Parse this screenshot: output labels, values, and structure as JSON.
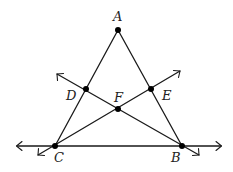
{
  "diagram": {
    "type": "geometry",
    "colors": {
      "line": "#1a1a1a",
      "point": "#000000",
      "label": "#222222",
      "background": "#ffffff"
    },
    "points": {
      "A": {
        "label": "A",
        "x": 118,
        "y": 30
      },
      "B": {
        "label": "B",
        "x": 182,
        "y": 146
      },
      "C": {
        "label": "C",
        "x": 55,
        "y": 146
      },
      "D": {
        "label": "D",
        "x": 86,
        "y": 89
      },
      "E": {
        "label": "E",
        "x": 151,
        "y": 89
      },
      "F": {
        "label": "F",
        "x": 118,
        "y": 109
      }
    },
    "segments": [
      {
        "name": "AC",
        "from": "A",
        "to": "C"
      },
      {
        "name": "AB",
        "from": "A",
        "to": "B"
      }
    ],
    "lines": [
      {
        "name": "line-CB",
        "through": [
          "C",
          "B"
        ],
        "arrows": "both"
      },
      {
        "name": "line-BD",
        "through": [
          "B",
          "F",
          "D"
        ],
        "arrows": "both"
      },
      {
        "name": "line-CE",
        "through": [
          "C",
          "F",
          "E"
        ],
        "arrows": "both"
      }
    ]
  }
}
